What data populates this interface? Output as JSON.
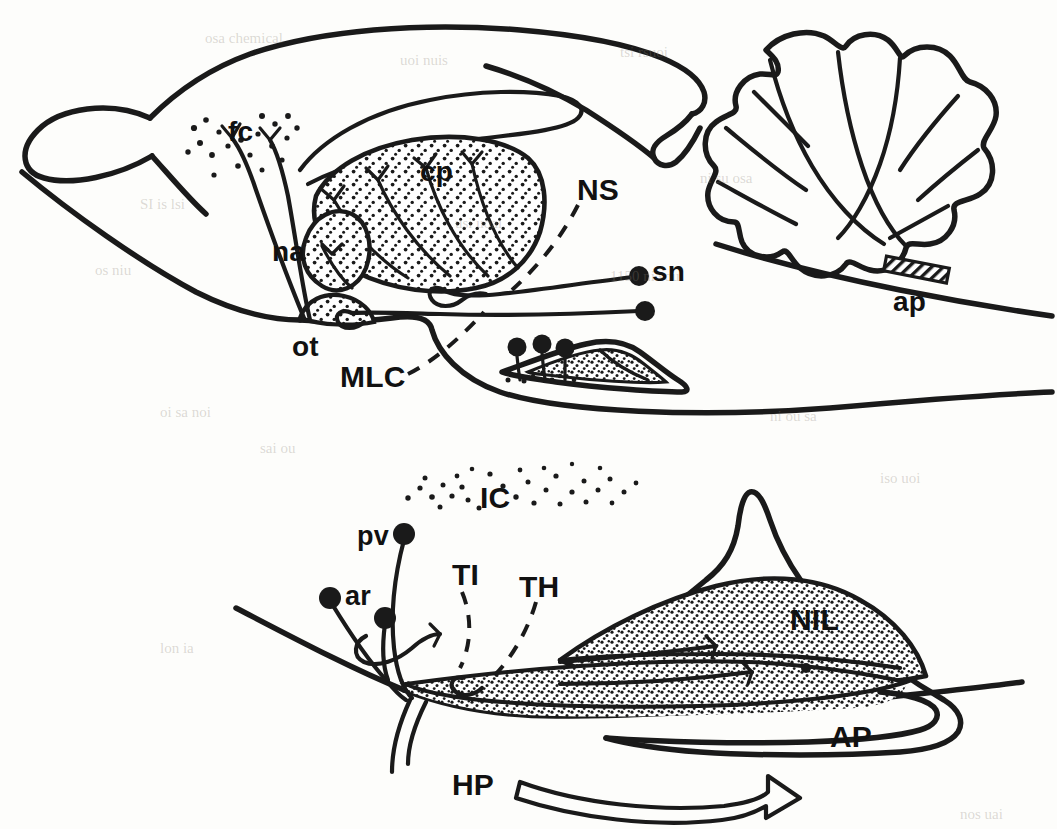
{
  "figure": {
    "background_color": "#fdfdfb",
    "ink_color": "#1a1a1a",
    "width": 1057,
    "height": 829,
    "panels": [
      {
        "id": "upper",
        "name": "whole-brain-sagittal"
      },
      {
        "id": "lower",
        "name": "pituitary-detail"
      }
    ]
  },
  "upper_panel": {
    "labels": [
      {
        "key": "fc",
        "text": "fc",
        "x": 228,
        "y": 118,
        "size": "lbl-upper",
        "meaning": "frontal-cortex-terminal-field"
      },
      {
        "key": "cp",
        "text": "cp",
        "x": 420,
        "y": 158,
        "size": "lbl-upper",
        "meaning": "caudate-putamen"
      },
      {
        "key": "na",
        "text": "na",
        "x": 272,
        "y": 238,
        "size": "lbl-upper",
        "meaning": "nucleus-accumbens"
      },
      {
        "key": "ot",
        "text": "ot",
        "x": 292,
        "y": 333,
        "size": "lbl-upper",
        "meaning": "olfactory-tubercle"
      },
      {
        "key": "NS",
        "text": "NS",
        "x": 577,
        "y": 175,
        "size": "lbl-big",
        "meaning": "neurosecretory-system"
      },
      {
        "key": "sn",
        "text": "sn",
        "x": 652,
        "y": 258,
        "size": "lbl-upper",
        "meaning": "substantia-nigra"
      },
      {
        "key": "MLC",
        "text": "MLC",
        "x": 340,
        "y": 362,
        "size": "lbl-big",
        "meaning": "mesolimbocortical-system"
      },
      {
        "key": "ap",
        "text": "ap",
        "x": 893,
        "y": 288,
        "size": "lbl-upper",
        "meaning": "area-postrema"
      }
    ]
  },
  "lower_panel": {
    "labels": [
      {
        "key": "IC",
        "text": "IC",
        "x": 480,
        "y": 483,
        "size": "lbl-big",
        "meaning": "intermediate-cortex-dot-field"
      },
      {
        "key": "pv",
        "text": "pv",
        "x": 357,
        "y": 523,
        "size": "lbl-lower",
        "meaning": "paraventricular-nucleus"
      },
      {
        "key": "ar",
        "text": "ar",
        "x": 345,
        "y": 583,
        "size": "lbl-lower",
        "meaning": "arcuate-nucleus"
      },
      {
        "key": "TI",
        "text": "TI",
        "x": 452,
        "y": 560,
        "size": "lbl-big",
        "meaning": "tuberoinfundibular-system"
      },
      {
        "key": "TH",
        "text": "TH",
        "x": 519,
        "y": 572,
        "size": "lbl-big",
        "meaning": "tuberohypophyseal-system"
      },
      {
        "key": "NIL",
        "text": "NIL",
        "x": 790,
        "y": 605,
        "size": "lbl-big",
        "meaning": "neurointermediate-lobe"
      },
      {
        "key": "AP",
        "text": "AP",
        "x": 830,
        "y": 722,
        "size": "lbl-big",
        "meaning": "anterior-pituitary"
      },
      {
        "key": "HP",
        "text": "HP",
        "x": 452,
        "y": 770,
        "size": "lbl-big",
        "meaning": "hypophyseal-portal-vessels"
      }
    ]
  },
  "ghost_text": [
    {
      "text": "osa  chemical",
      "x": 205,
      "y": 30
    },
    {
      "text": "uoi  nuis",
      "x": 400,
      "y": 52
    },
    {
      "text": "tsi  rsuoi",
      "x": 620,
      "y": 44
    },
    {
      "text": "SI  is  lsi",
      "x": 140,
      "y": 196
    },
    {
      "text": "usi  uoai",
      "x": 455,
      "y": 215
    },
    {
      "text": "ni  su  osa",
      "x": 700,
      "y": 170
    },
    {
      "text": "1150  ni  sou",
      "x": 610,
      "y": 268
    },
    {
      "text": "os  niu",
      "x": 95,
      "y": 262
    },
    {
      "text": "oi sa  noi",
      "x": 160,
      "y": 404
    },
    {
      "text": "ni ou  sa",
      "x": 770,
      "y": 408
    },
    {
      "text": "sai ou",
      "x": 260,
      "y": 440
    },
    {
      "text": "iso  uoi",
      "x": 880,
      "y": 470
    },
    {
      "text": "lon  ia",
      "x": 160,
      "y": 640
    },
    {
      "text": "nos  uai",
      "x": 960,
      "y": 806
    }
  ]
}
